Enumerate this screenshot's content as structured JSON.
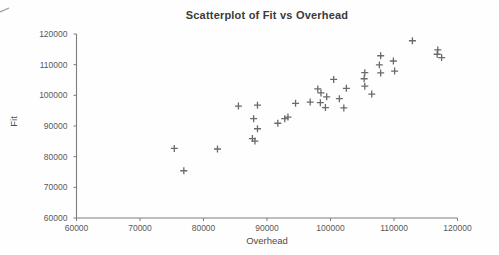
{
  "chart_data": {
    "type": "scatter",
    "title": "Scatterplot of Fit vs Overhead",
    "xlabel": "Overhead",
    "ylabel": "Fit",
    "xlim": [
      60000,
      120000
    ],
    "ylim": [
      60000,
      120000
    ],
    "x_ticks": [
      60000,
      70000,
      80000,
      90000,
      100000,
      110000,
      120000
    ],
    "y_ticks": [
      60000,
      70000,
      80000,
      90000,
      100000,
      110000,
      120000
    ],
    "grid": false,
    "legend": null,
    "marker": "plus",
    "marker_color": "#6a6a6a",
    "axis_color": "#7d7d7d",
    "tick_text_color": "#595959",
    "title_color": "#3a3a3a",
    "label_text_color": "#4d4d4d",
    "points": [
      [
        75400,
        82700
      ],
      [
        76900,
        75400
      ],
      [
        82200,
        82500
      ],
      [
        85500,
        96500
      ],
      [
        88500,
        96800
      ],
      [
        87900,
        92400
      ],
      [
        88500,
        89100
      ],
      [
        87700,
        85900
      ],
      [
        88100,
        85100
      ],
      [
        91700,
        90900
      ],
      [
        92800,
        92400
      ],
      [
        93300,
        92900
      ],
      [
        94500,
        97400
      ],
      [
        96800,
        97800
      ],
      [
        98000,
        102100
      ],
      [
        98500,
        100800
      ],
      [
        99400,
        99500
      ],
      [
        98400,
        97600
      ],
      [
        99200,
        96000
      ],
      [
        100500,
        105200
      ],
      [
        101400,
        98900
      ],
      [
        102500,
        102300
      ],
      [
        102100,
        95900
      ],
      [
        105400,
        107400
      ],
      [
        105300,
        105400
      ],
      [
        105400,
        103000
      ],
      [
        106500,
        100400
      ],
      [
        107700,
        109900
      ],
      [
        107900,
        107300
      ],
      [
        107900,
        112900
      ],
      [
        109900,
        111200
      ],
      [
        110100,
        107900
      ],
      [
        112900,
        117800
      ],
      [
        116900,
        114800
      ],
      [
        116800,
        113400
      ],
      [
        117500,
        112300
      ]
    ]
  }
}
